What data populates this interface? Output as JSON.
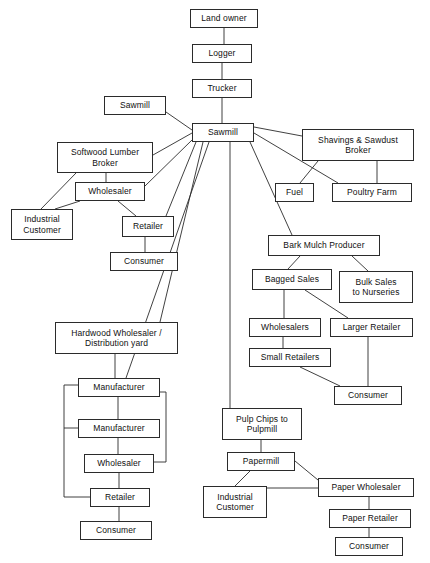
{
  "diagram": {
    "stroke_color": "#2b2b2b",
    "text_color": "#101010",
    "background": "#ffffff",
    "nodes": [
      {
        "id": "land_owner",
        "label": "Land owner",
        "x": 190,
        "y": 9,
        "w": 68,
        "h": 19
      },
      {
        "id": "logger",
        "label": "Logger",
        "x": 192,
        "y": 44,
        "w": 60,
        "h": 19
      },
      {
        "id": "trucker",
        "label": "Trucker",
        "x": 192,
        "y": 79,
        "w": 60,
        "h": 19
      },
      {
        "id": "sawmill_small",
        "label": "Sawmill",
        "x": 104,
        "y": 96,
        "w": 62,
        "h": 19
      },
      {
        "id": "sawmill_hub",
        "label": "Sawmill",
        "x": 192,
        "y": 123,
        "w": 62,
        "h": 19
      },
      {
        "id": "shavings_broker",
        "label": "Shavings & Sawdust\nBroker",
        "x": 302,
        "y": 129,
        "w": 112,
        "h": 32
      },
      {
        "id": "fuel",
        "label": "Fuel",
        "x": 275,
        "y": 183,
        "w": 39,
        "h": 19
      },
      {
        "id": "poultry_farm",
        "label": "Poultry Farm",
        "x": 332,
        "y": 183,
        "w": 80,
        "h": 19
      },
      {
        "id": "softwood_broker",
        "label": "Softwood Lumber\nBroker",
        "x": 57,
        "y": 142,
        "w": 96,
        "h": 31
      },
      {
        "id": "wholesaler_sw",
        "label": "Wholesaler",
        "x": 75,
        "y": 182,
        "w": 70,
        "h": 19
      },
      {
        "id": "industrial_cust_1",
        "label": "Industrial\nCustomer",
        "x": 11,
        "y": 209,
        "w": 62,
        "h": 31
      },
      {
        "id": "retailer_sw",
        "label": "Retailer",
        "x": 122,
        "y": 216,
        "w": 52,
        "h": 21
      },
      {
        "id": "consumer_sw",
        "label": "Consumer",
        "x": 110,
        "y": 252,
        "w": 68,
        "h": 19
      },
      {
        "id": "bark_mulch",
        "label": "Bark Mulch Producer",
        "x": 268,
        "y": 235,
        "w": 112,
        "h": 21
      },
      {
        "id": "bagged_sales",
        "label": "Bagged Sales",
        "x": 252,
        "y": 269,
        "w": 80,
        "h": 21
      },
      {
        "id": "bulk_sales",
        "label": "Bulk Sales\nto Nurseries",
        "x": 339,
        "y": 271,
        "w": 74,
        "h": 32
      },
      {
        "id": "wholesalers_bm",
        "label": "Wholesalers",
        "x": 249,
        "y": 318,
        "w": 72,
        "h": 19
      },
      {
        "id": "larger_retailer",
        "label": "Larger Retailer",
        "x": 330,
        "y": 318,
        "w": 83,
        "h": 19
      },
      {
        "id": "small_retailers",
        "label": "Small Retailers",
        "x": 249,
        "y": 348,
        "w": 82,
        "h": 19
      },
      {
        "id": "consumer_bm",
        "label": "Consumer",
        "x": 334,
        "y": 386,
        "w": 68,
        "h": 19
      },
      {
        "id": "hardwood_ws",
        "label": "Hardwood Wholesaler /\nDistribution yard",
        "x": 55,
        "y": 322,
        "w": 123,
        "h": 32
      },
      {
        "id": "manufacturer_1",
        "label": "Manufacturer",
        "x": 78,
        "y": 378,
        "w": 82,
        "h": 19
      },
      {
        "id": "manufacturer_2",
        "label": "Manufacturer",
        "x": 78,
        "y": 419,
        "w": 82,
        "h": 19
      },
      {
        "id": "wholesaler_hw",
        "label": "Wholesaler",
        "x": 84,
        "y": 454,
        "w": 70,
        "h": 19
      },
      {
        "id": "retailer_hw",
        "label": "Retailer",
        "x": 90,
        "y": 488,
        "w": 60,
        "h": 19
      },
      {
        "id": "consumer_hw",
        "label": "Consumer",
        "x": 80,
        "y": 521,
        "w": 72,
        "h": 19
      },
      {
        "id": "pulp_chips",
        "label": "Pulp Chips to\nPulpmill",
        "x": 222,
        "y": 408,
        "w": 80,
        "h": 32
      },
      {
        "id": "papermill",
        "label": "Papermill",
        "x": 227,
        "y": 452,
        "w": 68,
        "h": 19
      },
      {
        "id": "industrial_cust_2",
        "label": "Industrial\nCustomer",
        "x": 203,
        "y": 486,
        "w": 64,
        "h": 32
      },
      {
        "id": "paper_wholesaler",
        "label": "Paper Wholesaler",
        "x": 318,
        "y": 478,
        "w": 96,
        "h": 19
      },
      {
        "id": "paper_retailer",
        "label": "Paper Retailer",
        "x": 329,
        "y": 509,
        "w": 82,
        "h": 19
      },
      {
        "id": "consumer_paper",
        "label": "Consumer",
        "x": 335,
        "y": 537,
        "w": 68,
        "h": 19
      }
    ],
    "edges": [
      {
        "from": "land_owner",
        "to": "logger",
        "points": "224,28 224,44"
      },
      {
        "from": "logger",
        "to": "trucker",
        "points": "222,63 222,79"
      },
      {
        "from": "trucker",
        "to": "sawmill_hub",
        "points": "222,98 222,123"
      },
      {
        "from": "sawmill_small",
        "to": "sawmill_hub",
        "points": "166,112 192,130"
      },
      {
        "from": "sawmill_hub",
        "to": "softwood_broker",
        "points": "192,133 153,155"
      },
      {
        "from": "sawmill_hub",
        "to": "wholesaler_sw",
        "points": "192,140 145,186"
      },
      {
        "from": "sawmill_hub",
        "to": "retailer_sw",
        "points": "196,142 166,216"
      },
      {
        "from": "sawmill_hub",
        "to": "hardwood_ws",
        "points": "203,142 160,322"
      },
      {
        "from": "sawmill_hub",
        "to": "manufacturer_1",
        "points": "209,142 126,378"
      },
      {
        "from": "sawmill_hub",
        "to": "pulp_chips",
        "points": "230,142 230,408"
      },
      {
        "from": "sawmill_hub",
        "to": "shavings_broker",
        "points": "254,127 302,136"
      },
      {
        "from": "sawmill_hub",
        "to": "poultry_farm",
        "points": "254,133 338,183"
      },
      {
        "from": "sawmill_hub",
        "to": "bark_mulch",
        "points": "250,142 292,235"
      },
      {
        "from": "shavings_broker",
        "to": "fuel",
        "points": "318,161 300,183"
      },
      {
        "from": "shavings_broker",
        "to": "poultry_farm",
        "points": "377,161 377,183"
      },
      {
        "from": "softwood_broker",
        "to": "industrial_cust_1",
        "points": "76,173 41,209"
      },
      {
        "from": "softwood_broker",
        "to": "wholesaler_sw",
        "points": "106,173 106,182"
      },
      {
        "from": "wholesaler_sw",
        "to": "industrial_cust_1",
        "points": "80,201 55,209"
      },
      {
        "from": "wholesaler_sw",
        "to": "retailer_sw",
        "points": "118,201 136,216"
      },
      {
        "from": "retailer_sw",
        "to": "consumer_sw",
        "points": "145,237 145,252"
      },
      {
        "from": "bark_mulch",
        "to": "bagged_sales",
        "points": "300,256 288,269"
      },
      {
        "from": "bark_mulch",
        "to": "bulk_sales",
        "points": "352,256 368,271"
      },
      {
        "from": "bagged_sales",
        "to": "wholesalers_bm",
        "points": "284,290 284,318"
      },
      {
        "from": "bagged_sales",
        "to": "larger_retailer",
        "points": "305,290 348,318"
      },
      {
        "from": "wholesalers_bm",
        "to": "small_retailers",
        "points": "283,337 283,348"
      },
      {
        "from": "small_retailers",
        "to": "consumer_bm",
        "points": "300,367 340,386"
      },
      {
        "from": "larger_retailer",
        "to": "consumer_bm",
        "points": "368,337 368,386"
      },
      {
        "from": "hardwood_ws",
        "to": "manufacturer_1",
        "points": "115,354 115,378"
      },
      {
        "from": "manufacturer_1",
        "to": "manufacturer_2",
        "points": "118,397 118,419"
      },
      {
        "from": "manufacturer_1",
        "to": "wholesaler_hw",
        "points": "160,392 166,392 166,462 154,462"
      },
      {
        "from": "manufacturer_1",
        "to": "retailer_hw",
        "points": "78,385 64,385 64,497 90,497"
      },
      {
        "from": "manufacturer_2",
        "to": "retailer_hw",
        "points": "78,428 64,428"
      },
      {
        "from": "manufacturer_2",
        "to": "wholesaler_hw",
        "points": "118,438 118,454"
      },
      {
        "from": "wholesaler_hw",
        "to": "retailer_hw",
        "points": "119,473 119,488"
      },
      {
        "from": "retailer_hw",
        "to": "consumer_hw",
        "points": "119,507 119,521"
      },
      {
        "from": "pulp_chips",
        "to": "papermill",
        "points": "261,440 261,452"
      },
      {
        "from": "papermill",
        "to": "industrial_cust_2",
        "points": "250,471 235,486"
      },
      {
        "from": "papermill",
        "to": "paper_wholesaler",
        "points": "295,461 318,480"
      },
      {
        "from": "paper_wholesaler",
        "to": "industrial_cust_2",
        "points": "318,488 267,488"
      },
      {
        "from": "paper_wholesaler",
        "to": "paper_retailer",
        "points": "369,497 369,509"
      },
      {
        "from": "paper_retailer",
        "to": "consumer_paper",
        "points": "369,528 369,537"
      }
    ]
  }
}
